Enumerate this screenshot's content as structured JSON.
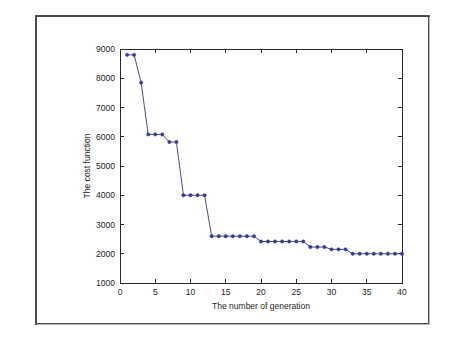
{
  "figure": {
    "background_color": "#ffffff",
    "frame_color": "#4a4e52"
  },
  "chart_data": {
    "type": "line",
    "title": "",
    "subtitle": "",
    "xlabel": "The number of generation",
    "ylabel": "The cost function",
    "xlim": [
      0,
      40
    ],
    "ylim": [
      1000,
      9000
    ],
    "xticks": [
      0,
      5,
      10,
      15,
      20,
      25,
      30,
      35,
      40
    ],
    "xtick_labels": [
      "0",
      "5",
      "10",
      "15",
      "20",
      "25",
      "30",
      "35",
      "40"
    ],
    "yticks": [
      1000,
      2000,
      3000,
      4000,
      5000,
      6000,
      7000,
      8000,
      9000
    ],
    "ytick_labels": [
      "1000",
      "2000",
      "3000",
      "4000",
      "5000",
      "6000",
      "7000",
      "8000",
      "9000"
    ],
    "grid": false,
    "legend": null,
    "legend_position": "none",
    "annotations": [],
    "series": [
      {
        "name": "cost",
        "color": "#4a4a9c",
        "marker": "dot",
        "line_style": "solid",
        "x": [
          1,
          2,
          3,
          4,
          5,
          6,
          7,
          8,
          9,
          10,
          11,
          12,
          13,
          14,
          15,
          16,
          17,
          18,
          19,
          20,
          21,
          22,
          23,
          24,
          25,
          26,
          27,
          28,
          29,
          30,
          31,
          32,
          33,
          34,
          35,
          36,
          37,
          38,
          39,
          40
        ],
        "values": [
          8800,
          8800,
          7850,
          6080,
          6080,
          6080,
          5820,
          5820,
          4000,
          4000,
          4000,
          4000,
          2600,
          2600,
          2600,
          2600,
          2600,
          2600,
          2600,
          2420,
          2420,
          2420,
          2420,
          2420,
          2420,
          2420,
          2230,
          2230,
          2230,
          2150,
          2150,
          2150,
          2000,
          2000,
          2000,
          2000,
          2000,
          2000,
          2000,
          2000
        ]
      }
    ]
  }
}
